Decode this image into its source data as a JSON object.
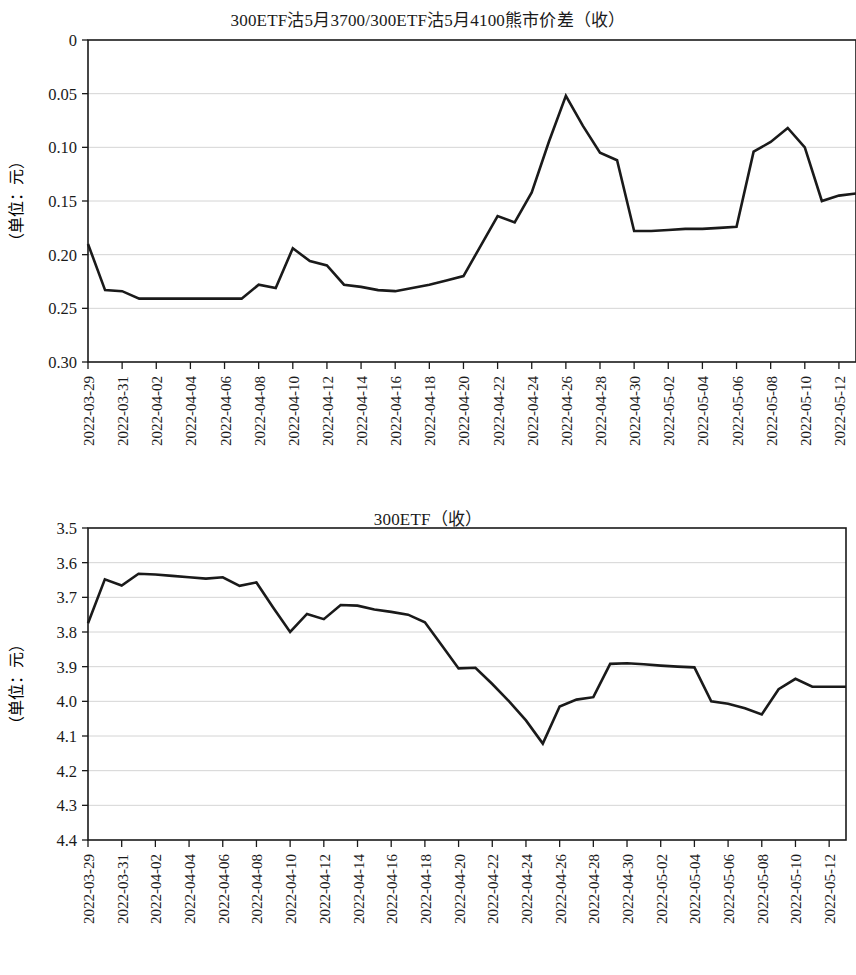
{
  "page": {
    "background": "#ffffff",
    "line_color": "#1a1a1a",
    "grid_color": "#c9c9c9"
  },
  "chart1": {
    "title": "300ETF沽5月3700/300ETF沽5月4100熊市价差（收）",
    "ylabel": "（单位：元）",
    "ytick_labels": [
      "0.30",
      "0.25",
      "0.20",
      "0.15",
      "0.10",
      "0.05",
      "0"
    ]
  },
  "chart2": {
    "title": "300ETF（收）",
    "ylabel": "（单位：元）",
    "ytick_labels": [
      "4.4",
      "4.3",
      "4.2",
      "4.1",
      "4.0",
      "3.9",
      "3.8",
      "3.7",
      "3.6",
      "3.5"
    ]
  },
  "xtick_labels": [
    "2022-03-29",
    "2022-03-31",
    "2022-04-02",
    "2022-04-04",
    "2022-04-06",
    "2022-04-08",
    "2022-04-10",
    "2022-04-12",
    "2022-04-14",
    "2022-04-16",
    "2022-04-18",
    "2022-04-20",
    "2022-04-22",
    "2022-04-24",
    "2022-04-26",
    "2022-04-28",
    "2022-04-30",
    "2022-05-02",
    "2022-05-04",
    "2022-05-06",
    "2022-05-08",
    "2022-05-10",
    "2022-05-12"
  ],
  "chart_data": [
    {
      "type": "line",
      "title": "300ETF沽5月3700/300ETF沽5月4100熊市价差（收）",
      "xlabel": "",
      "ylabel": "（单位：元）",
      "ylim": [
        0,
        0.3
      ],
      "yticks": [
        0,
        0.05,
        0.1,
        0.15,
        0.2,
        0.25,
        0.3
      ],
      "grid": true,
      "legend": "none",
      "x": [
        "2022-03-29",
        "2022-03-30",
        "2022-03-31",
        "2022-04-01",
        "2022-04-02",
        "2022-04-03",
        "2022-04-04",
        "2022-04-05",
        "2022-04-06",
        "2022-04-07",
        "2022-04-08",
        "2022-04-09",
        "2022-04-10",
        "2022-04-11",
        "2022-04-12",
        "2022-04-13",
        "2022-04-14",
        "2022-04-15",
        "2022-04-16",
        "2022-04-17",
        "2022-04-18",
        "2022-04-19",
        "2022-04-20",
        "2022-04-21",
        "2022-04-22",
        "2022-04-23",
        "2022-04-24",
        "2022-04-25",
        "2022-04-26",
        "2022-04-27",
        "2022-04-28",
        "2022-04-29",
        "2022-04-30",
        "2022-05-01",
        "2022-05-02",
        "2022-05-03",
        "2022-05-04",
        "2022-05-05",
        "2022-05-06",
        "2022-05-07",
        "2022-05-08",
        "2022-05-09",
        "2022-05-10",
        "2022-05-11",
        "2022-05-12",
        "2022-05-13"
      ],
      "values": [
        0.11,
        0.067,
        0.066,
        0.059,
        0.059,
        0.059,
        0.059,
        0.059,
        0.059,
        0.059,
        0.072,
        0.069,
        0.106,
        0.094,
        0.09,
        0.072,
        0.07,
        0.067,
        0.066,
        0.069,
        0.072,
        0.076,
        0.08,
        0.108,
        0.136,
        0.13,
        0.158,
        0.205,
        0.248,
        0.22,
        0.195,
        0.188,
        0.122,
        0.122,
        0.123,
        0.124,
        0.124,
        0.125,
        0.126,
        0.196,
        0.205,
        0.218,
        0.2,
        0.15,
        0.155,
        0.157
      ]
    },
    {
      "type": "line",
      "title": "300ETF（收）",
      "xlabel": "",
      "ylabel": "（单位：元）",
      "ylim": [
        3.5,
        4.4
      ],
      "yticks": [
        3.5,
        3.6,
        3.7,
        3.8,
        3.9,
        4.0,
        4.1,
        4.2,
        4.3,
        4.4
      ],
      "grid": true,
      "legend": "none",
      "x": [
        "2022-03-29",
        "2022-03-30",
        "2022-03-31",
        "2022-04-01",
        "2022-04-02",
        "2022-04-03",
        "2022-04-04",
        "2022-04-05",
        "2022-04-06",
        "2022-04-07",
        "2022-04-08",
        "2022-04-09",
        "2022-04-10",
        "2022-04-11",
        "2022-04-12",
        "2022-04-13",
        "2022-04-14",
        "2022-04-15",
        "2022-04-16",
        "2022-04-17",
        "2022-04-18",
        "2022-04-19",
        "2022-04-20",
        "2022-04-21",
        "2022-04-22",
        "2022-04-23",
        "2022-04-24",
        "2022-04-25",
        "2022-04-26",
        "2022-04-27",
        "2022-04-28",
        "2022-04-29",
        "2022-04-30",
        "2022-05-01",
        "2022-05-02",
        "2022-05-03",
        "2022-05-04",
        "2022-05-05",
        "2022-05-06",
        "2022-05-07",
        "2022-05-08",
        "2022-05-09",
        "2022-05-10",
        "2022-05-11",
        "2022-05-12",
        "2022-05-13"
      ],
      "values": [
        4.125,
        4.252,
        4.234,
        4.268,
        4.266,
        4.262,
        4.258,
        4.254,
        4.258,
        4.233,
        4.243,
        4.17,
        4.1,
        4.152,
        4.137,
        4.178,
        4.176,
        4.165,
        4.158,
        4.15,
        4.128,
        4.062,
        3.995,
        3.997,
        3.95,
        3.9,
        3.845,
        3.778,
        3.885,
        3.905,
        3.912,
        4.008,
        4.01,
        4.007,
        4.003,
        4.0,
        3.998,
        3.9,
        3.893,
        3.88,
        3.862,
        3.935,
        3.965,
        3.942,
        3.942,
        3.942
      ]
    }
  ]
}
